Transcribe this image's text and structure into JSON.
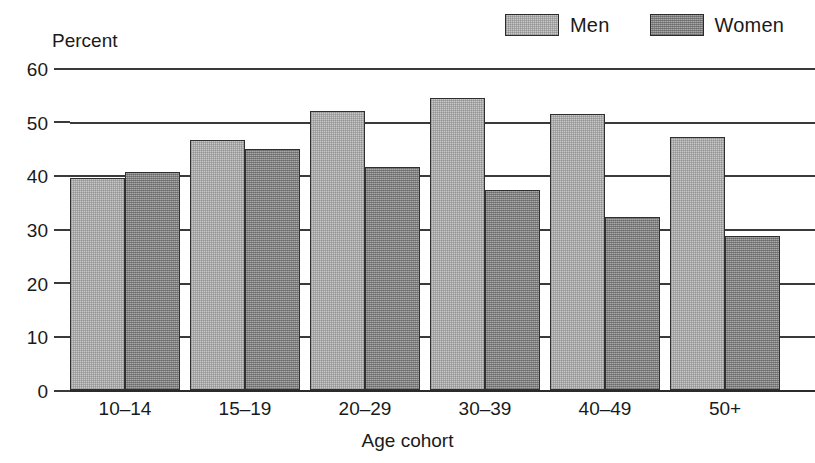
{
  "chart_data": {
    "type": "bar",
    "title": "",
    "subtitle": "",
    "xlabel": "Age cohort",
    "ylabel": "Percent",
    "ylim": [
      0,
      60
    ],
    "ytick_labels": [
      "0",
      "10",
      "20",
      "30",
      "40",
      "50",
      "60"
    ],
    "ytick_values": [
      0,
      10,
      20,
      30,
      40,
      50,
      60
    ],
    "grid": true,
    "legend_position": "top-right",
    "categories": [
      "10–14",
      "15–19",
      "20–29",
      "30–39",
      "40–49",
      "50+"
    ],
    "series": [
      {
        "name": "Men",
        "color": "#c9c9c9",
        "values": [
          39.5,
          46.6,
          52.0,
          54.5,
          51.5,
          47.2
        ]
      },
      {
        "name": "Women",
        "color": "#8f8f8f",
        "values": [
          40.7,
          44.9,
          41.5,
          37.3,
          32.3,
          28.7
        ]
      }
    ]
  },
  "legend": {
    "entries": [
      {
        "label": "Men",
        "swatch": "men-swatch"
      },
      {
        "label": "Women",
        "swatch": "women-swatch"
      }
    ]
  },
  "axes": {
    "y_title": "Percent",
    "x_title": "Age cohort"
  }
}
